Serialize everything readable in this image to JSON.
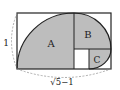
{
  "diagram": {
    "regions": [
      {
        "id": "A",
        "label": "A"
      },
      {
        "id": "B",
        "label": "B"
      },
      {
        "id": "C",
        "label": "C"
      }
    ],
    "dimensions": {
      "height_label": "1",
      "width_label": "√5−1"
    },
    "colors": {
      "shade": "#bdbdbd",
      "line": "#222222",
      "dashed": "#999999",
      "background": "#ffffff"
    }
  }
}
